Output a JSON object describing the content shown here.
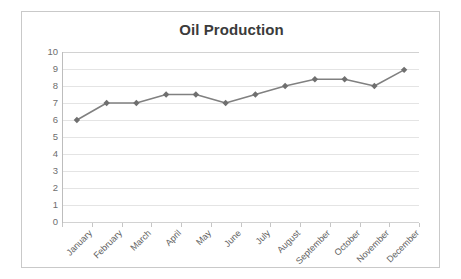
{
  "chart_data": {
    "type": "line",
    "title": "Oil Production",
    "xlabel": "",
    "ylabel": "",
    "categories": [
      "January",
      "February",
      "March",
      "April",
      "May",
      "June",
      "July",
      "August",
      "September",
      "October",
      "November",
      "December"
    ],
    "values": [
      6.0,
      7.0,
      7.0,
      7.5,
      7.5,
      7.0,
      7.5,
      8.0,
      8.4,
      8.4,
      8.0,
      8.95
    ],
    "series": [
      {
        "name": "Oil Production",
        "values": [
          6.0,
          7.0,
          7.0,
          7.5,
          7.5,
          7.0,
          7.5,
          8.0,
          8.4,
          8.4,
          8.0,
          8.95
        ]
      }
    ],
    "ylim": [
      0,
      10
    ],
    "y_ticks": [
      0,
      1,
      2,
      3,
      4,
      5,
      6,
      7,
      8,
      9,
      10
    ],
    "y_tick_labels": [
      "0",
      "1",
      "2",
      "3",
      "4",
      "5",
      "6",
      "7",
      "8",
      "9",
      "10"
    ],
    "grid": true,
    "grid_axis": "y",
    "legend": false,
    "legend_position": "none",
    "marker": "diamond",
    "x_label_rotation": -45
  },
  "style": {
    "line_color": "#808080",
    "marker_color": "#6f6f6f",
    "grid_color": "#e4e4e4",
    "axis_color": "#bdbdbd",
    "title_color": "#3b3b3b",
    "tick_label_color": "#6e6e6e",
    "frame_border_color": "#c9c9c9",
    "background": "#ffffff"
  }
}
